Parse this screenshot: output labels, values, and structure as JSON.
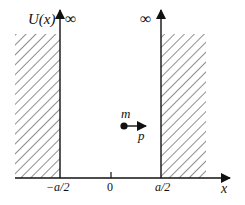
{
  "diagram": {
    "y_axis_label": "U(x)",
    "x_axis_label": "x",
    "left_wall_label": "∞",
    "right_wall_label": "∞",
    "ticks": [
      {
        "label": "−a/2",
        "position": -0.5
      },
      {
        "label": "0",
        "position": 0
      },
      {
        "label": "a/2",
        "position": 0.5
      }
    ],
    "particle": {
      "mass_label": "m",
      "momentum_label": "p"
    },
    "colors": {
      "line": "#111111",
      "hatch": "#333333",
      "background": "#ffffff"
    }
  }
}
